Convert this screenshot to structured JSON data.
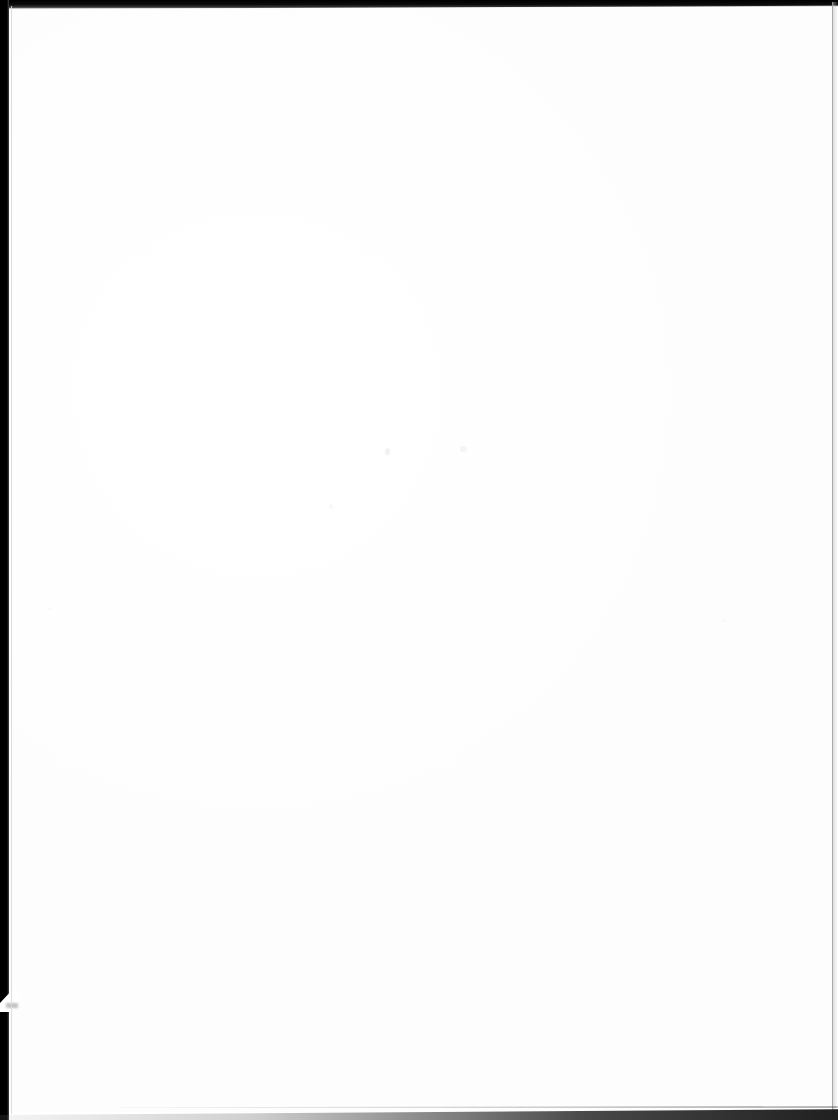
{
  "document": {
    "kind": "scanned-page",
    "page_content_text": "",
    "page_state_label": "",
    "width_px": 838,
    "height_px": 1120,
    "background_color": "#ffffff"
  },
  "artifacts": {
    "left_edge": {
      "name": "left-scan-edge",
      "color": "#000000",
      "width_px": 9,
      "description_label": ""
    },
    "left_notch": {
      "name": "torn-corner-notch",
      "color": "#ffffff",
      "top_px": 988,
      "description_label": ""
    },
    "top_edge": {
      "name": "top-scan-edge",
      "color": "#0d0d0d",
      "height_px": 9,
      "description_label": ""
    },
    "right_rule": {
      "name": "right-page-rule",
      "color": "#9e9e9e",
      "x_px": 832,
      "description_label": ""
    },
    "bottom_edge": {
      "name": "bottom-scan-edge",
      "color": "#3c3c3c",
      "y_px": 1106,
      "description_label": ""
    },
    "specks": [
      {
        "label": "",
        "x": 385,
        "y": 448,
        "color": "#e9e9ec"
      },
      {
        "label": "",
        "x": 460,
        "y": 446,
        "color": "#e9e9ec"
      },
      {
        "label": "",
        "x": 330,
        "y": 504,
        "color": "#e9e9ec"
      },
      {
        "label": "",
        "x": 722,
        "y": 619,
        "color": "#e9e9ec"
      },
      {
        "label": "",
        "x": 48,
        "y": 607,
        "color": "#e9e9ec"
      }
    ]
  }
}
